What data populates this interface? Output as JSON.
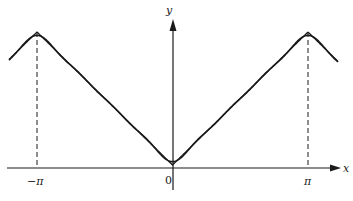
{
  "figure": {
    "type": "fourier-approximation-diagram",
    "axes": {
      "x_label": "x",
      "y_label": "y",
      "origin_label": "0",
      "tick_labels": [
        "−π",
        "π"
      ]
    },
    "curves": [
      {
        "name": "exact-function",
        "description": "periodic extension of |x| (triangle wave)",
        "style": "smooth"
      },
      {
        "name": "fourier-partial-sum",
        "description": "partial Fourier sum oscillating about the exact function",
        "style": "wavy"
      }
    ],
    "guides": [
      {
        "name": "dashed-line-minus-pi",
        "at": "−π"
      },
      {
        "name": "dashed-line-pi",
        "at": "π"
      }
    ],
    "colors": {
      "ink": "#1a1a1a",
      "background": "#ffffff"
    }
  }
}
